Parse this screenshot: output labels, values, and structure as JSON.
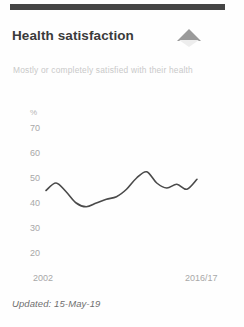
{
  "card": {
    "title": "Health satisfaction",
    "subtitle": "Mostly or completely satisfied with their health",
    "footer": "Updated: 15-May-19",
    "trend_icon": "up-triangle-icon",
    "accent_color": "#444444",
    "line_color": "#4a4a4a",
    "tick_color": "#a8a8a8",
    "subtitle_color": "#c9c9c9"
  },
  "chart_data": {
    "type": "line",
    "title": "Health satisfaction",
    "subtitle": "Mostly or completely satisfied with their health",
    "xlabel": "",
    "ylabel": "%",
    "unit": "%",
    "ylim": [
      20,
      72
    ],
    "yticks": [
      70,
      60,
      50,
      40,
      30,
      20
    ],
    "ytick_labels": [
      "70",
      "60",
      "50",
      "40",
      "30",
      "20"
    ],
    "xticks": [
      "2002",
      "2016/17"
    ],
    "grid": false,
    "legend": false,
    "categories": [
      "2002",
      "2003",
      "2004",
      "2005",
      "2006",
      "2007",
      "2008",
      "2009",
      "2010",
      "2011",
      "2012",
      "2013",
      "2014",
      "2015",
      "2016",
      "2016/17"
    ],
    "values": [
      45.0,
      48.0,
      44.5,
      40.0,
      38.5,
      40.0,
      41.5,
      42.5,
      45.5,
      50.0,
      52.5,
      48.0,
      46.0,
      47.5,
      45.5,
      49.5
    ]
  }
}
